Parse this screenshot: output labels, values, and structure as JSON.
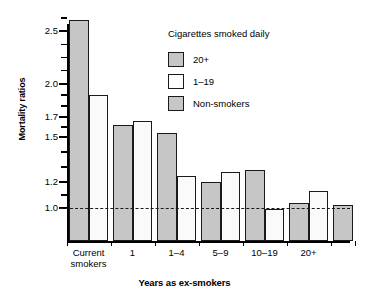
{
  "chart_data": {
    "type": "bar",
    "title": "",
    "xlabel": "Years as ex-smokers",
    "ylabel": "Mortality ratios",
    "y_ticks": [
      1.0,
      1.2,
      1.5,
      1.7,
      2.0,
      2.5
    ],
    "y_tick_labels": [
      "1.0",
      "1.2",
      "1.5",
      "1.7",
      "2.0",
      "2.5"
    ],
    "ylim": [
      0.85,
      2.7
    ],
    "grid": false,
    "reference_line": 1.0,
    "legend_position": "upper-center-right",
    "legend_title": "Cigarettes smoked daily",
    "categories": [
      "Current smokers",
      "1",
      "1–4",
      "5–9",
      "10–19",
      "20+"
    ],
    "series": [
      {
        "name": "20+",
        "color": "#c6c6c6",
        "values": [
          2.6,
          1.62,
          1.54,
          1.2,
          1.28,
          1.04
        ]
      },
      {
        "name": "1–19",
        "color": "#fafafa",
        "values": [
          1.9,
          1.66,
          1.24,
          1.27,
          0.99,
          1.13
        ]
      }
    ],
    "extra_bars": [
      {
        "name": "Non-smokers",
        "color": "#c6c6c6",
        "value": 1.02
      }
    ],
    "bars": [
      {
        "group": "Current smokers",
        "series": "20+",
        "value": 2.6,
        "fill": "dark"
      },
      {
        "group": "Current smokers",
        "series": "1–19",
        "value": 1.9,
        "fill": "light"
      },
      {
        "group": "1",
        "series": "20+",
        "value": 1.62,
        "fill": "dark"
      },
      {
        "group": "1",
        "series": "1–19",
        "value": 1.66,
        "fill": "light"
      },
      {
        "group": "1–4",
        "series": "20+",
        "value": 1.54,
        "fill": "dark"
      },
      {
        "group": "1–4",
        "series": "1–19",
        "value": 1.24,
        "fill": "light"
      },
      {
        "group": "5–9",
        "series": "20+",
        "value": 1.2,
        "fill": "dark"
      },
      {
        "group": "5–9",
        "series": "1–19",
        "value": 1.27,
        "fill": "light"
      },
      {
        "group": "10–19",
        "series": "20+",
        "value": 1.28,
        "fill": "dark"
      },
      {
        "group": "10–19",
        "series": "1–19",
        "value": 0.99,
        "fill": "light"
      },
      {
        "group": "20+",
        "series": "20+",
        "value": 1.04,
        "fill": "dark"
      },
      {
        "group": "20+",
        "series": "1–19",
        "value": 1.13,
        "fill": "light"
      },
      {
        "group": "Non-smokers",
        "series": "Non-smokers",
        "value": 1.02,
        "fill": "dark"
      }
    ]
  },
  "axes": {
    "y_title": "Mortality ratios",
    "x_title": "Years as ex-smokers",
    "y_labels": [
      "2.5",
      "2.0",
      "1.7",
      "1.5",
      "1.2",
      "1.0"
    ],
    "x_labels": [
      "Current\nsmokers",
      "1",
      "1–4",
      "5–9",
      "10–19",
      "20+"
    ]
  },
  "legend": {
    "title": "Cigarettes smoked daily",
    "items": [
      {
        "label": "20+",
        "fill": "dark"
      },
      {
        "label": "1–19",
        "fill": "light"
      },
      {
        "label": "Non-smokers",
        "fill": "dark"
      }
    ]
  },
  "colors": {
    "bar_dark": "#c6c6c6",
    "bar_light": "#fafafa",
    "outline": "#1a1a1a",
    "axis": "#000000",
    "background": "#ffffff"
  }
}
